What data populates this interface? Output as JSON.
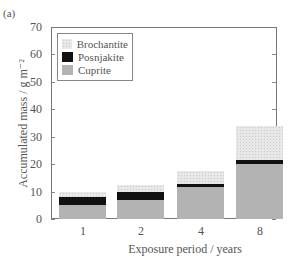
{
  "panel_label": "(a)",
  "chart_data": {
    "type": "bar",
    "stacked": true,
    "title": "",
    "xlabel": "Exposure period  / years",
    "ylabel": "Accumulated mass / g m⁻²",
    "categories": [
      "1",
      "2",
      "4",
      "8"
    ],
    "series": [
      {
        "name": "Cuprite",
        "values": [
          5.0,
          7.0,
          11.5,
          20.0
        ],
        "color": "#b3b3b3"
      },
      {
        "name": "Posnjakite",
        "values": [
          3.0,
          3.0,
          1.2,
          1.5
        ],
        "color": "#111111"
      },
      {
        "name": "Brochantite",
        "values": [
          1.8,
          2.5,
          4.8,
          12.5
        ],
        "color": "#e8e8e8"
      }
    ],
    "ylim": [
      0,
      70
    ],
    "yticks": [
      0,
      10,
      20,
      30,
      40,
      50,
      60,
      70
    ],
    "grid": false,
    "legend_position": "upper left",
    "legend_order": [
      "Brochantite",
      "Posnjakite",
      "Cuprite"
    ]
  }
}
